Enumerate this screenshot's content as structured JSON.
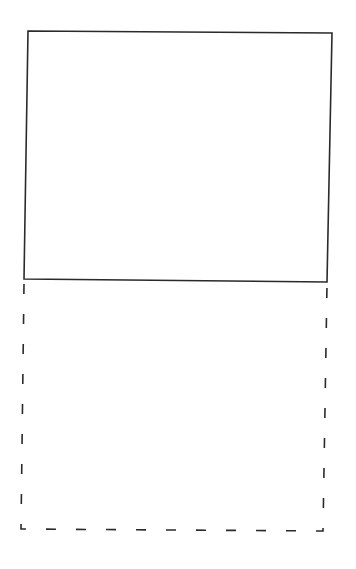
{
  "diagram": {
    "shapes": [
      {
        "id": "solid-box",
        "style": "solid",
        "stroke": "#2a2a2a",
        "points": [
          [
            28,
            31
          ],
          [
            332,
            33
          ],
          [
            327,
            282
          ],
          [
            24,
            279
          ]
        ]
      },
      {
        "id": "dashed-box",
        "style": "dashed",
        "stroke": "#2a2a2a",
        "points": [
          [
            24,
            284
          ],
          [
            327,
            285
          ],
          [
            323,
            531
          ],
          [
            21,
            529
          ]
        ]
      }
    ],
    "background": "#ffffff"
  }
}
